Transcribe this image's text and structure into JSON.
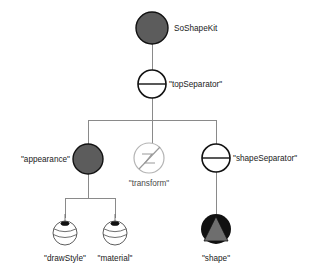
{
  "diagram": {
    "type": "node-kit-tree",
    "colors": {
      "background": "#ffffff",
      "edge": "#8a8a8a",
      "kit_fill": "#5c5c5c",
      "separator_fill": "#ffffff",
      "separator_stroke": "#111111",
      "transform_stroke": "#b4b4b4",
      "property_fill": "#ffffff",
      "shape_disc": "#111111",
      "shape_cone": "#6e6e6e",
      "label": "#1a1a1a"
    },
    "nodes": {
      "root": {
        "label": "SoShapeKit",
        "icon": "filled-circle-icon",
        "label_side": "right"
      },
      "top_separator": {
        "label": "\"topSeparator\"",
        "icon": "separator-circle-icon",
        "label_side": "right"
      },
      "appearance": {
        "label": "\"appearance\"",
        "icon": "filled-circle-icon",
        "label_side": "left"
      },
      "transform": {
        "label": "\"transform\"",
        "icon": "transform-circle-icon",
        "label_side": "below"
      },
      "shape_separator": {
        "label": "\"shapeSeparator\"",
        "icon": "separator-circle-icon",
        "label_side": "right"
      },
      "draw_style": {
        "label": "\"drawStyle\"",
        "icon": "property-sphere-icon",
        "label_side": "below"
      },
      "material": {
        "label": "\"material\"",
        "icon": "property-sphere-icon",
        "label_side": "below"
      },
      "shape": {
        "label": "\"shape\"",
        "icon": "cone-shape-icon",
        "label_side": "below"
      }
    },
    "edges": [
      {
        "from": "root",
        "to": "top_separator"
      },
      {
        "from": "top_separator",
        "to": "appearance"
      },
      {
        "from": "top_separator",
        "to": "transform"
      },
      {
        "from": "top_separator",
        "to": "shape_separator"
      },
      {
        "from": "appearance",
        "to": "draw_style"
      },
      {
        "from": "appearance",
        "to": "material"
      },
      {
        "from": "shape_separator",
        "to": "shape"
      }
    ]
  }
}
